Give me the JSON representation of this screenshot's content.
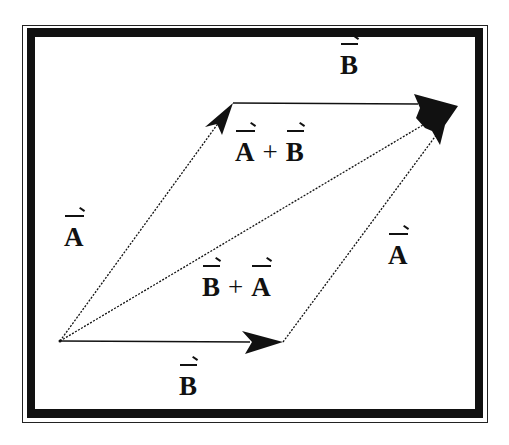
{
  "diagram": {
    "labels": {
      "top_b": "B",
      "left_a": "A",
      "right_a": "A",
      "bottom_b": "B",
      "sum_ab": {
        "first": "A",
        "op": "+",
        "second": "B"
      },
      "sum_ba": {
        "first": "B",
        "op": "+",
        "second": "A"
      }
    },
    "vectors": [
      {
        "name": "A",
        "from": "origin",
        "to": "top-left-vertex"
      },
      {
        "name": "B",
        "from": "top-left-vertex",
        "to": "far-vertex"
      },
      {
        "name": "B",
        "from": "origin",
        "to": "bottom-right-vertex"
      },
      {
        "name": "A",
        "from": "bottom-right-vertex",
        "to": "far-vertex"
      },
      {
        "name": "A + B",
        "from": "origin",
        "to": "far-vertex"
      }
    ],
    "colors": {
      "ink": "#111111",
      "background": "#ffffff"
    }
  }
}
